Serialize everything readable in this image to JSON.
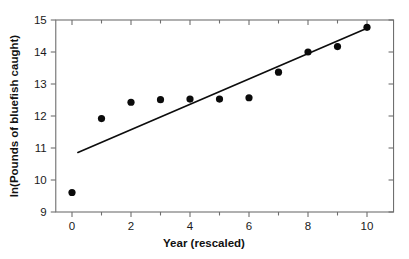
{
  "chart_data": {
    "type": "scatter",
    "title": "",
    "xlabel": "Year (rescaled)",
    "ylabel": "ln(Pounds of bluefish caught)",
    "xlim": [
      -0.55,
      10.9
    ],
    "ylim": [
      9,
      15
    ],
    "xticks": [
      0,
      2,
      4,
      6,
      8,
      10
    ],
    "xtick_labels": [
      "0",
      "2",
      "4",
      "6",
      "8",
      "10"
    ],
    "xticks_minor": [
      1,
      3,
      5,
      7,
      9
    ],
    "yticks": [
      9,
      10,
      11,
      12,
      13,
      14,
      15
    ],
    "ytick_labels": [
      "9",
      "10",
      "11",
      "12",
      "13",
      "14",
      "15"
    ],
    "grid": false,
    "legend": false,
    "x": [
      0,
      1,
      2,
      3,
      4,
      5,
      6,
      7,
      8,
      9,
      10
    ],
    "y": [
      9.61,
      11.92,
      12.43,
      12.51,
      12.53,
      12.53,
      12.57,
      13.37,
      14.0,
      14.17,
      14.77
    ],
    "series": [
      {
        "name": "bluefish-observations",
        "type": "scatter",
        "marker": "circle",
        "color": "#0b0b0b",
        "values": [
          9.61,
          11.92,
          12.43,
          12.51,
          12.53,
          12.53,
          12.57,
          13.37,
          14.0,
          14.17,
          14.77
        ]
      },
      {
        "name": "least-squares-fit",
        "type": "line",
        "color": "#0d0d0d",
        "x_start": 0.2,
        "y_start": 10.86,
        "x_end": 10.0,
        "y_end": 14.74
      }
    ],
    "annotations": []
  },
  "axes": {
    "x_axis_name": "Year (rescaled)",
    "y_axis_name": "ln(Pounds of bluefish caught)"
  }
}
